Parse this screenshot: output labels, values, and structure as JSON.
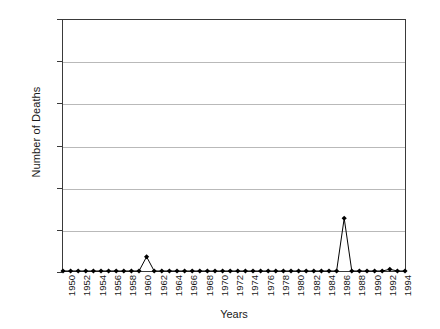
{
  "chart_data": {
    "type": "line",
    "title": "",
    "xlabel": "Years",
    "ylabel": "Number of Deaths",
    "xlim": [
      1950,
      1995
    ],
    "ylim": [
      0,
      300
    ],
    "ytick_values": [
      0,
      50,
      100,
      150,
      200,
      250,
      300
    ],
    "ytick_labels": [
      "0",
      "50",
      "100",
      "150",
      "200",
      "250",
      "300"
    ],
    "xtick_labels": [
      "1950",
      "1952",
      "1954",
      "1956",
      "1958",
      "1960",
      "1962",
      "1964",
      "1966",
      "1968",
      "1970",
      "1972",
      "1974",
      "1976",
      "1978",
      "1980",
      "1982",
      "1984",
      "1986",
      "1988",
      "1990",
      "1992",
      "1994"
    ],
    "xtick_interval": 2,
    "grid": "horizontal",
    "legend": "none",
    "marker": "diamond",
    "line_color": "#000000",
    "marker_color": "#000000",
    "grid_color": "#b9b9b9",
    "axis_color": "#3a3a3a",
    "x": [
      1950,
      1951,
      1952,
      1953,
      1954,
      1955,
      1956,
      1957,
      1958,
      1959,
      1960,
      1961,
      1962,
      1963,
      1964,
      1965,
      1966,
      1967,
      1968,
      1969,
      1970,
      1971,
      1972,
      1973,
      1974,
      1975,
      1976,
      1977,
      1978,
      1979,
      1980,
      1981,
      1982,
      1983,
      1984,
      1985,
      1986,
      1987,
      1988,
      1989,
      1990,
      1991,
      1992,
      1993,
      1994,
      1995
    ],
    "values": [
      0,
      0,
      0,
      0,
      0,
      0,
      0,
      0,
      0,
      0,
      0,
      17,
      0,
      0,
      0,
      0,
      0,
      0,
      0,
      0,
      0,
      0,
      0,
      0,
      0,
      0,
      0,
      0,
      0,
      0,
      0,
      0,
      0,
      0,
      0,
      0,
      0,
      63,
      0,
      0,
      0,
      0,
      0,
      2,
      0,
      0
    ],
    "series": [
      {
        "name": "Number of Deaths",
        "values": [
          0,
          0,
          0,
          0,
          0,
          0,
          0,
          0,
          0,
          0,
          0,
          17,
          0,
          0,
          0,
          0,
          0,
          0,
          0,
          0,
          0,
          0,
          0,
          0,
          0,
          0,
          0,
          0,
          0,
          0,
          0,
          0,
          0,
          0,
          0,
          0,
          0,
          63,
          0,
          0,
          0,
          0,
          0,
          2,
          0,
          0
        ]
      }
    ],
    "annotations": [
      {
        "label": "peak 1961",
        "x": 1961,
        "y": 17
      },
      {
        "label": "peak 1987",
        "x": 1987,
        "y": 63
      }
    ]
  }
}
